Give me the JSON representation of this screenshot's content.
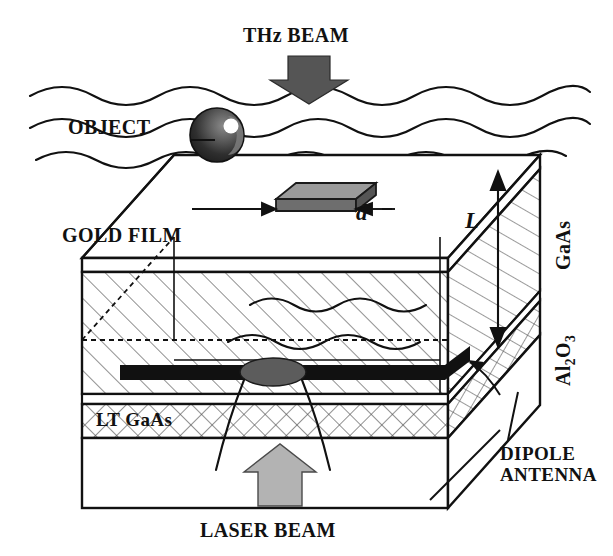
{
  "figure": {
    "background_color": "#ffffff",
    "line_color": "#111111",
    "width": 613,
    "height": 556
  },
  "labels": {
    "thz_beam": "THz BEAM",
    "object": "OBJECT",
    "gold_film": "GOLD FILM",
    "gaas": "GaAs",
    "al2o3_main": "Al",
    "al2o3_sub1": "2",
    "al2o3_mid": "O",
    "al2o3_sub2": "3",
    "lt_gaas": "LT GaAs",
    "dipole_antenna_line1": "DIPOLE",
    "dipole_antenna_line2": "ANTENNA",
    "laser_beam": "LASER BEAM",
    "dimension_d": "d",
    "dimension_L": "L"
  },
  "colors": {
    "thz_arrow_fill": "#555555",
    "laser_arrow_fill": "#b3b3b3",
    "object_sphere_dark": "#2b2b2b",
    "object_sphere_mid": "#6e6e6e",
    "object_highlight": "#ffffff",
    "sample_slab_top": "#8c8c8c",
    "sample_slab_side": "#6a6a6a",
    "antenna_black": "#111111",
    "laser_spot_gray": "#5c5c5c",
    "hatch_line": "#444444",
    "outline": "#111111"
  },
  "elements": {
    "thz_arrow": "downward-block-arrow",
    "laser_arrow": "upward-block-arrow",
    "wavefronts_above_count": 3,
    "wavefronts_inside_count": 2,
    "wavefronts_at_gap_count": 1,
    "antenna_arms": 2,
    "laser_spot": "ellipse",
    "gaas_hatch": "diagonal-single",
    "lt_gaas_hatch": "cross-hatch",
    "hidden_edges": "dashed"
  }
}
